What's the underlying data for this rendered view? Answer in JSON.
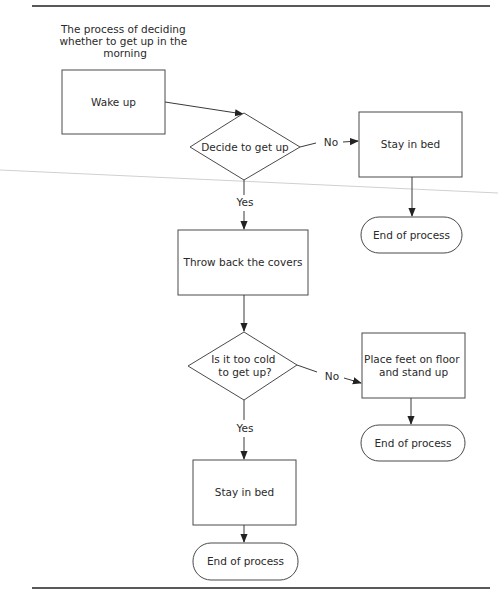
{
  "title": {
    "lines": [
      "The process of deciding",
      "whether to get up in the",
      "morning"
    ]
  },
  "nodes": {
    "wake_up": {
      "type": "process",
      "label": "Wake up"
    },
    "decide": {
      "type": "decision",
      "label": "Decide to get up"
    },
    "stay_in_bed_1": {
      "type": "process",
      "label": "Stay in bed"
    },
    "end_1": {
      "type": "terminator",
      "label": "End of process"
    },
    "throw_back": {
      "type": "process",
      "label": "Throw back the covers"
    },
    "too_cold": {
      "type": "decision",
      "lines": [
        "Is it too cold",
        "to get up?"
      ]
    },
    "place_feet": {
      "type": "process",
      "lines": [
        "Place feet on floor",
        "and stand up"
      ]
    },
    "end_2": {
      "type": "terminator",
      "label": "End of process"
    },
    "stay_in_bed_2": {
      "type": "process",
      "label": "Stay in bed"
    },
    "end_3": {
      "type": "terminator",
      "label": "End of process"
    }
  },
  "edges": {
    "decide_no": {
      "label": "No"
    },
    "decide_yes": {
      "label": "Yes"
    },
    "cold_no": {
      "label": "No"
    },
    "cold_yes": {
      "label": "Yes"
    }
  },
  "colors": {
    "stroke": "#4a4a4a",
    "text": "#2a2a2a",
    "rule": "#222222",
    "background": "#ffffff"
  }
}
